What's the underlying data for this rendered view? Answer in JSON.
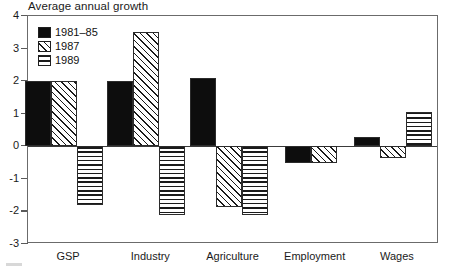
{
  "chart_data": {
    "type": "bar",
    "title": "Average annual growth",
    "xlabel": "",
    "ylabel": "",
    "ylim": [
      -3,
      4
    ],
    "yticks": [
      4,
      3,
      2,
      1,
      0,
      -1,
      -2,
      -3
    ],
    "ytick_labels": [
      "4",
      "3",
      "2",
      "1",
      "0",
      "-1",
      "-2",
      "-3"
    ],
    "grid": false,
    "legend_position": "upper-left-inside",
    "categories": [
      "GSP",
      "Industry",
      "Agriculture",
      "Employment",
      "Wages"
    ],
    "series": [
      {
        "name": "1981–85",
        "fill": "solid",
        "values": [
          2.0,
          2.0,
          2.1,
          -0.5,
          0.3
        ]
      },
      {
        "name": "1987",
        "fill": "diagonal-hatch",
        "values": [
          2.0,
          3.5,
          -1.85,
          -0.5,
          -0.35
        ]
      },
      {
        "name": "1989",
        "fill": "horizontal-lines",
        "values": [
          -1.8,
          -2.1,
          -2.1,
          null,
          1.05
        ]
      }
    ]
  },
  "legend": {
    "items": [
      {
        "label": "1981–85",
        "fill": "solid"
      },
      {
        "label": "1987",
        "fill": "diagonal-hatch"
      },
      {
        "label": "1989",
        "fill": "horizontal-lines"
      }
    ]
  },
  "axis": {
    "y_tick_labels": [
      "4",
      "3",
      "2",
      "1",
      "0",
      "-1",
      "-2",
      "-3"
    ],
    "x_tick_labels": [
      "GSP",
      "Industry",
      "Agriculture",
      "Employment",
      "Wages"
    ]
  },
  "colors": {
    "ink": "#0d0d0d",
    "frame": "#6b6b6b",
    "background": "#ffffff"
  }
}
